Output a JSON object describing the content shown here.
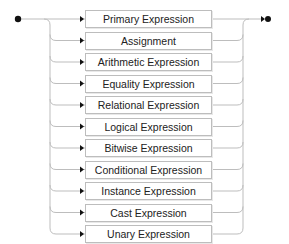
{
  "diagram": {
    "type": "railroad",
    "start_marker": "start-dot",
    "end_marker": "end-arrow-dot",
    "line_color": "#bdbdbd",
    "marker_color": "#111111",
    "alternatives": [
      {
        "label": "Primary Expression"
      },
      {
        "label": "Assignment"
      },
      {
        "label": "Arithmetic Expression"
      },
      {
        "label": "Equality Expression"
      },
      {
        "label": "Relational Expression"
      },
      {
        "label": "Logical Expression"
      },
      {
        "label": "Bitwise Expression"
      },
      {
        "label": "Conditional Expression"
      },
      {
        "label": "Instance Expression"
      },
      {
        "label": "Cast Expression"
      },
      {
        "label": "Unary Expression"
      }
    ]
  }
}
